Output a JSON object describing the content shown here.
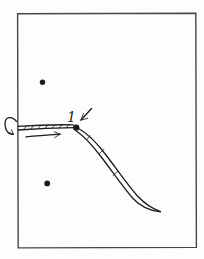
{
  "figure": {
    "point_label": "1"
  },
  "colors": {
    "paper": "#fdfdfc",
    "frame": "#474747",
    "ink": "#1c1c1c"
  },
  "icons": {
    "rotation_arrow": "↷",
    "flow_arrow": "→",
    "pointer_arrow": "↙"
  }
}
